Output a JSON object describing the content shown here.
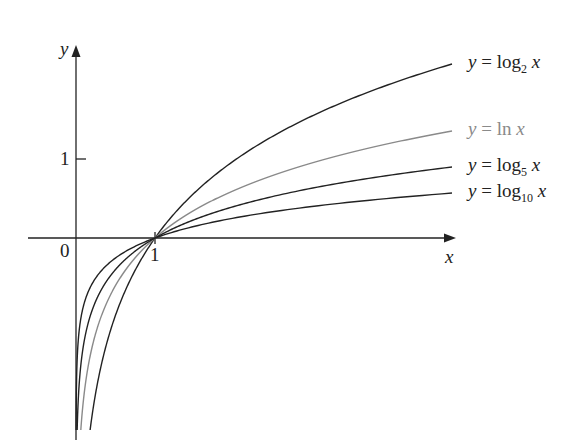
{
  "chart_data": {
    "type": "line",
    "title": "",
    "xlabel": "x",
    "ylabel": "y",
    "axis_ticks": {
      "x": [
        "0",
        "1"
      ],
      "y": [
        "1"
      ]
    },
    "origin_label": "0",
    "grid": false,
    "legend_position": "inline-right",
    "series": [
      {
        "name": "y = log2 x",
        "base": "2",
        "color": "#222222",
        "label_prefix": "y = log",
        "label_sub": "2",
        "label_suffix": " x",
        "end_value_approx": 2.2
      },
      {
        "name": "y = ln x",
        "base": "e",
        "color": "#8a8a8a",
        "label_prefix": "y = ln",
        "label_sub": "",
        "label_suffix": " x",
        "end_value_approx": 1.35
      },
      {
        "name": "y = log5 x",
        "base": "5",
        "color": "#222222",
        "label_prefix": "y = log",
        "label_sub": "5",
        "label_suffix": " x",
        "end_value_approx": 0.9
      },
      {
        "name": "y = log10 x",
        "base": "10",
        "color": "#222222",
        "label_prefix": "y = log",
        "label_sub": "10",
        "label_suffix": " x",
        "end_value_approx": 0.57
      }
    ],
    "common_point": {
      "x": 1,
      "y": 0
    },
    "xlim": [
      -0.6,
      4.9
    ],
    "ylim": [
      -2.6,
      2.2
    ]
  }
}
